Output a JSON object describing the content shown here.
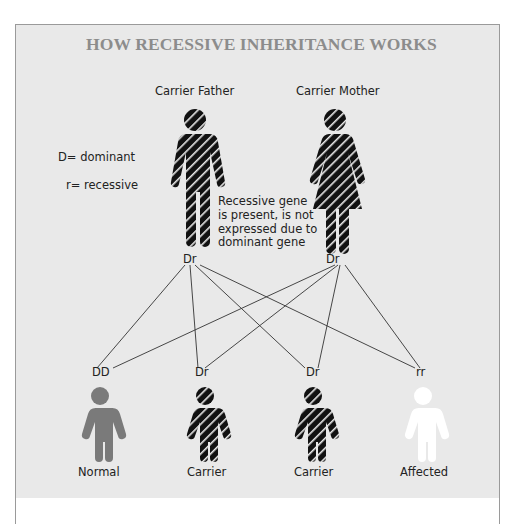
{
  "title": "HOW RECESSIVE INHERITANCE WORKS",
  "legend": {
    "dominant": "D= dominant",
    "recessive": "r= recessive"
  },
  "parents": [
    {
      "label": "Carrier Father",
      "genotype": "Dr",
      "figure": "man-icon",
      "pattern": "striped"
    },
    {
      "label": "Carrier Mother",
      "genotype": "Dr",
      "figure": "woman-icon",
      "pattern": "striped"
    }
  ],
  "annotation": "Recessive gene is present, is not expressed due to dominant gene",
  "annotation_lines": [
    "Recessive gene",
    "is present, is not",
    "expressed due to",
    "dominant gene"
  ],
  "children": [
    {
      "genotype": "DD",
      "label": "Normal",
      "fill": "#7a7a7a",
      "pattern": "solid"
    },
    {
      "genotype": "Dr",
      "label": "Carrier",
      "fill": "#111111",
      "pattern": "striped"
    },
    {
      "genotype": "Dr",
      "label": "Carrier",
      "fill": "#111111",
      "pattern": "striped"
    },
    {
      "genotype": "rr",
      "label": "Affected",
      "fill": "#ffffff",
      "pattern": "solid"
    }
  ],
  "colors": {
    "background": "#e9e9e9",
    "title": "#8c8c8c",
    "line": "#333333",
    "normal": "#7a7a7a",
    "carrier": "#111111",
    "affected": "#ffffff"
  }
}
